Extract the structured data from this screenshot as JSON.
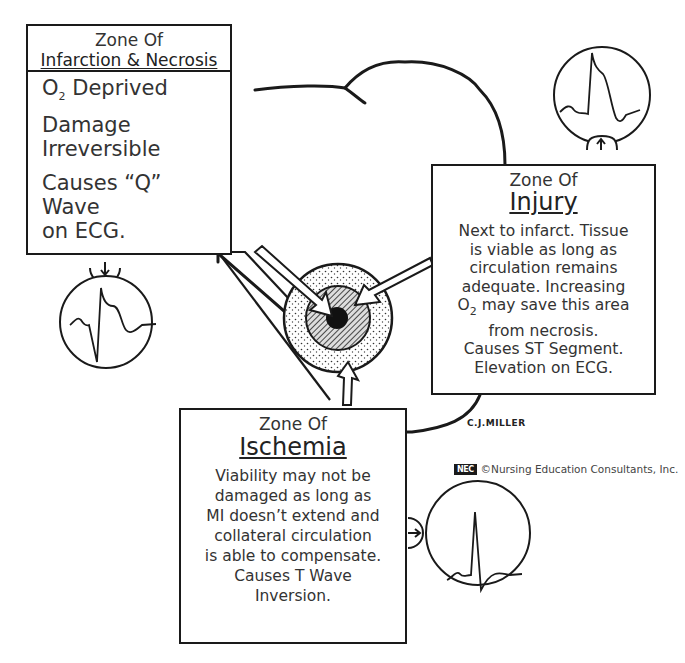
{
  "diagram": {
    "zones": {
      "infarction": {
        "heading": "Zone Of",
        "title": "Infarction & Necrosis",
        "lines": [
          "O",
          "2",
          " Deprived",
          "Damage",
          "Irreversible",
          "Causes “Q” Wave",
          "on ECG."
        ],
        "ecg": "Q wave",
        "arrow_direction": "down"
      },
      "injury": {
        "heading": "Zone Of",
        "title": "Injury",
        "lines": [
          "Next to infarct. Tissue",
          "is viable as long as",
          "circulation remains",
          "adequate. Increasing",
          "O",
          "2",
          " may save this area",
          "from necrosis.",
          "Causes ST Segment.",
          "Elevation on ECG."
        ],
        "ecg": "ST segment elevation",
        "arrow_direction": "up"
      },
      "ischemia": {
        "heading": "Zone Of",
        "title": "Ischemia",
        "lines": [
          "Viability may not be",
          "damaged as long as",
          "MI doesn’t extend and",
          "collateral circulation",
          "is able to compensate.",
          "Causes T Wave",
          "Inversion."
        ],
        "ecg": "T wave inversion",
        "arrow_direction": "right"
      }
    },
    "credit": "C.J.MILLER",
    "copyright": {
      "logo": "NEC",
      "text": "©Nursing Education Consultants, Inc."
    },
    "colors": {
      "ink": "#1a1a1a",
      "paper": "#ffffff",
      "text": "#333333"
    }
  }
}
